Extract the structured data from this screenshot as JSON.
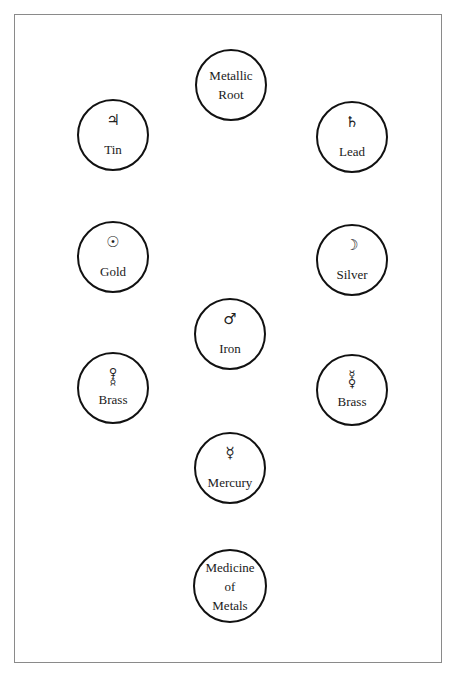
{
  "diagram": {
    "nodes": [
      {
        "id": "metallic-root",
        "lines": [
          "Metallic",
          "Root"
        ]
      },
      {
        "id": "tin",
        "symbol": "♃",
        "symbol_name": "jupiter",
        "label": "Tin"
      },
      {
        "id": "lead",
        "symbol": "♄",
        "symbol_name": "saturn",
        "label": "Lead"
      },
      {
        "id": "gold",
        "symbol": "☉",
        "symbol_name": "sun",
        "label": "Gold"
      },
      {
        "id": "silver",
        "symbol": "☽",
        "symbol_name": "moon",
        "label": "Silver"
      },
      {
        "id": "iron",
        "symbol": "♂",
        "symbol_name": "mars",
        "label": "Iron"
      },
      {
        "id": "brass-left",
        "symbol_stack": [
          "♀",
          "☿"
        ],
        "symbol_name": "venus-over-mercury",
        "label": "Brass"
      },
      {
        "id": "brass-right",
        "symbol_stack": [
          "☿",
          "♀"
        ],
        "symbol_name": "mercury-over-venus",
        "label": "Brass"
      },
      {
        "id": "mercury",
        "symbol": "☿",
        "symbol_name": "mercury",
        "label": "Mercury"
      },
      {
        "id": "medicine-of-metals",
        "lines": [
          "Medicine",
          "of",
          "Metals"
        ]
      }
    ]
  }
}
